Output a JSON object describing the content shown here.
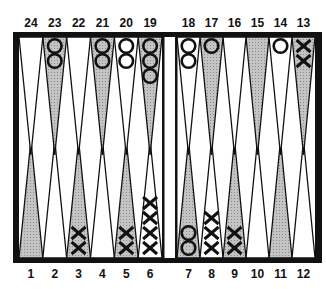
{
  "board": {
    "colors": {
      "frame": "#111111",
      "dark_point": "#b8b8b8",
      "light_point": "#ffffff",
      "background": "#ffffff"
    },
    "top_labels": [
      "24",
      "23",
      "22",
      "21",
      "20",
      "19",
      "18",
      "17",
      "16",
      "15",
      "14",
      "13"
    ],
    "bottom_labels": [
      "1",
      "2",
      "3",
      "4",
      "5",
      "6",
      "7",
      "8",
      "9",
      "10",
      "11",
      "12"
    ],
    "points": [
      {
        "point": 1,
        "checkers": 0,
        "type": ""
      },
      {
        "point": 2,
        "checkers": 0,
        "type": ""
      },
      {
        "point": 3,
        "checkers": 2,
        "type": "X"
      },
      {
        "point": 4,
        "checkers": 0,
        "type": ""
      },
      {
        "point": 5,
        "checkers": 2,
        "type": "X"
      },
      {
        "point": 6,
        "checkers": 4,
        "type": "X"
      },
      {
        "point": 7,
        "checkers": 2,
        "type": "O"
      },
      {
        "point": 8,
        "checkers": 3,
        "type": "X"
      },
      {
        "point": 9,
        "checkers": 2,
        "type": "X"
      },
      {
        "point": 10,
        "checkers": 0,
        "type": ""
      },
      {
        "point": 11,
        "checkers": 0,
        "type": ""
      },
      {
        "point": 12,
        "checkers": 0,
        "type": ""
      },
      {
        "point": 13,
        "checkers": 2,
        "type": "X"
      },
      {
        "point": 14,
        "checkers": 1,
        "type": "O"
      },
      {
        "point": 15,
        "checkers": 0,
        "type": ""
      },
      {
        "point": 16,
        "checkers": 0,
        "type": ""
      },
      {
        "point": 17,
        "checkers": 1,
        "type": "O"
      },
      {
        "point": 18,
        "checkers": 2,
        "type": "O"
      },
      {
        "point": 19,
        "checkers": 3,
        "type": "O"
      },
      {
        "point": 20,
        "checkers": 2,
        "type": "O"
      },
      {
        "point": 21,
        "checkers": 2,
        "type": "O"
      },
      {
        "point": 22,
        "checkers": 0,
        "type": ""
      },
      {
        "point": 23,
        "checkers": 2,
        "type": "O"
      },
      {
        "point": 24,
        "checkers": 0,
        "type": ""
      }
    ]
  }
}
